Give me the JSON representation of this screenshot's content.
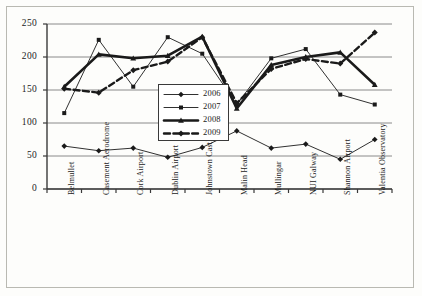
{
  "chart_data": {
    "type": "line",
    "title": "",
    "xlabel": "",
    "ylabel": "",
    "ylim": [
      0,
      250
    ],
    "yticks": [
      0,
      50,
      100,
      150,
      200,
      250
    ],
    "grid": true,
    "legend_position": "center",
    "categories": [
      "Belmullet",
      "Casement Aerodrome",
      "Cork Airport",
      "Dublin Airport",
      "Johnstown Castle",
      "Malin Head",
      "Mullingar",
      "NUI Galway",
      "Shannon Airport",
      "Valentia Observatory"
    ],
    "series": [
      {
        "name": "2006",
        "marker": "diamond",
        "style": "solid",
        "values": [
          65,
          58,
          62,
          48,
          63,
          88,
          62,
          68,
          45,
          75
        ]
      },
      {
        "name": "2007",
        "marker": "square",
        "style": "solid",
        "values": [
          115,
          226,
          155,
          230,
          205,
          128,
          198,
          212,
          143,
          128
        ]
      },
      {
        "name": "2008",
        "marker": "triangle",
        "style": "solid-thick",
        "values": [
          155,
          204,
          198,
          202,
          231,
          122,
          188,
          200,
          207,
          158
        ]
      },
      {
        "name": "2009",
        "marker": "diamond",
        "style": "dashed",
        "values": [
          152,
          146,
          180,
          193,
          230,
          130,
          182,
          197,
          190,
          237
        ]
      }
    ]
  },
  "legend": {
    "items": [
      {
        "label": "2006"
      },
      {
        "label": "2007"
      },
      {
        "label": "2008"
      },
      {
        "label": "2009"
      }
    ]
  },
  "colors": {
    "axis": "#3a3a3a",
    "grid": "#8a8a8a",
    "series": "#1a1a1a",
    "frame": "#b9b9b2",
    "background": "#fdfdfb"
  }
}
